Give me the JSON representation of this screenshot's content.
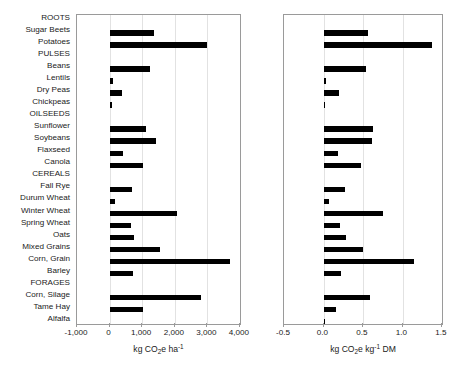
{
  "chart_data": {
    "type": "bar",
    "orientation": "horizontal",
    "title": "",
    "grid": true,
    "legend": false,
    "categories": [
      "ROOTS",
      "Sugar Beets",
      "Potatoes",
      "PULSES",
      "Beans",
      "Lentils",
      "Dry Peas",
      "Chickpeas",
      "OILSEEDS",
      "Sunflower",
      "Soybeans",
      "Flaxseed",
      "Canola",
      "CEREALS",
      "Fall Rye",
      "Durum Wheat",
      "Winter Wheat",
      "Spring Wheat",
      "Oats",
      "Mixed Grains",
      "Corn, Grain",
      "Barley",
      "FORAGES",
      "Corn, Silage",
      "Tame Hay",
      "Alfalfa"
    ],
    "panels": [
      {
        "id": "left",
        "xlabel": "kg CO2e ha-1",
        "xlabel_parts": {
          "lead": "kg CO",
          "sub": "2",
          "mid": "e ha",
          "sup": "-1"
        },
        "xlim": [
          -1000,
          4000
        ],
        "xticks": [
          -1000,
          0,
          1000,
          2000,
          3000,
          4000
        ],
        "xticklabels": [
          "-1,000",
          "0",
          "1,000",
          "2,000",
          "3,000",
          "4,000"
        ],
        "values": [
          null,
          1350,
          3000,
          null,
          1240,
          95,
          390,
          70,
          null,
          1120,
          1430,
          420,
          1020,
          null,
          700,
          180,
          2080,
          650,
          740,
          1540,
          3700,
          730,
          null,
          2800,
          1030,
          null
        ]
      },
      {
        "id": "right",
        "xlabel": "kg CO2e kg-1 DM",
        "xlabel_parts": {
          "lead": "kg CO",
          "sub": "2",
          "mid": "e kg",
          "sup": "-1",
          "tail": " DM"
        },
        "xlim": [
          -0.5,
          1.5
        ],
        "xticks": [
          -0.5,
          0.0,
          0.5,
          1.0,
          1.5
        ],
        "xticklabels": [
          "-0.5",
          "0.0",
          "0.5",
          "1.0",
          "1.5"
        ],
        "values": [
          null,
          0.56,
          1.37,
          null,
          0.54,
          0.03,
          0.2,
          0.025,
          null,
          0.63,
          0.61,
          0.18,
          0.48,
          null,
          0.27,
          0.07,
          0.75,
          0.21,
          0.28,
          0.5,
          1.15,
          0.22,
          null,
          0.59,
          0.16,
          0.01
        ]
      }
    ]
  }
}
